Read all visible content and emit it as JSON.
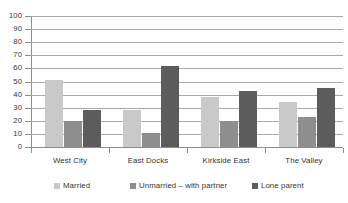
{
  "chart_data": {
    "type": "bar",
    "title": "",
    "xlabel": "",
    "ylabel": "",
    "ylim": [
      0,
      100
    ],
    "ytick_step": 10,
    "grid": true,
    "legend_position": "bottom",
    "categories": [
      "West City",
      "East Docks",
      "Kirkside East",
      "The Valley"
    ],
    "yticks": [
      "100",
      "90",
      "80",
      "70",
      "60",
      "50",
      "40",
      "30",
      "20",
      "10",
      "0"
    ],
    "series": [
      {
        "name": "Married",
        "color": "#c9c9c9",
        "values": [
          51,
          28,
          38,
          34
        ]
      },
      {
        "name": "Unmarried  –  with partner",
        "color": "#8e8e8e",
        "values": [
          20,
          11,
          20,
          23
        ]
      },
      {
        "name": "Lone parent",
        "color": "#5c5c5c",
        "values": [
          28,
          62,
          43,
          45
        ]
      }
    ]
  },
  "title_strip": {
    "text": ""
  },
  "legend": {
    "items": [
      {
        "label": "Married",
        "color": "#c9c9c9"
      },
      {
        "label": "Unmarried  –  with partner",
        "color": "#8e8e8e"
      },
      {
        "label": "Lone parent",
        "color": "#5c5c5c"
      }
    ]
  },
  "colors": {
    "axis": "#8d8d8d",
    "grid": "#a9a9a9",
    "text": "#333333",
    "background": "#ffffff"
  }
}
